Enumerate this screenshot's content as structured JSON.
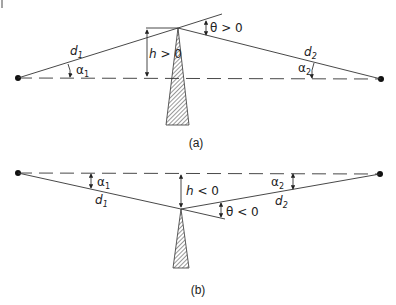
{
  "figure": {
    "panels": [
      {
        "id": "a",
        "caption": "(a)",
        "labels": {
          "d1": "d",
          "d1_sub": "1",
          "d2": "d",
          "d2_sub": "2",
          "alpha1": "α",
          "alpha1_sub": "1",
          "alpha2": "α",
          "alpha2_sub": "2",
          "h": "h > 0",
          "theta": "θ > 0"
        }
      },
      {
        "id": "b",
        "caption": "(b)",
        "labels": {
          "d1": "d",
          "d1_sub": "1",
          "d2": "d",
          "d2_sub": "2",
          "alpha1": "α",
          "alpha1_sub": "1",
          "alpha2": "α",
          "alpha2_sub": "2",
          "h": "h < 0",
          "theta": "θ < 0"
        }
      }
    ],
    "colors": {
      "line": "#333333",
      "background": "#ffffff"
    }
  }
}
